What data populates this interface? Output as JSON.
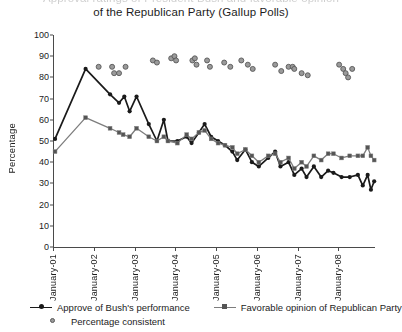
{
  "title": {
    "line_clipped": "Approval ratings of President Bush and favorable opinion",
    "line_visible": "of the Republican Party (Gallup Polls)"
  },
  "axes": {
    "ylabel": "Percentage",
    "yticks": [
      0,
      10,
      20,
      30,
      40,
      50,
      60,
      70,
      80,
      90,
      100
    ],
    "ymin": 0,
    "ymax": 100,
    "xticks": [
      "January-01",
      "January-02",
      "January-03",
      "January-04",
      "January-05",
      "January-06",
      "January-07",
      "January-08"
    ]
  },
  "legend": {
    "items": [
      {
        "label": "Approve of Bush's performance",
        "marker": "circle-line",
        "color": "#1a1a1a"
      },
      {
        "label": "Favorable opinion of Republican Party",
        "marker": "square-line",
        "color": "#7d7d7d"
      },
      {
        "label": "Percentage consistent",
        "marker": "circle-dot",
        "color": "#8a8a8a"
      }
    ]
  },
  "colors": {
    "approval_line": "#1a1a1a",
    "republican_line": "#7d7d7d",
    "consistent_dot_fill": "#9a9a9a",
    "consistent_dot_stroke": "#585858",
    "axis": "#4a4a4a",
    "text": "#1c1c1c"
  },
  "chart_data": {
    "type": "line",
    "title": "Approval ratings of President Bush and favorable opinion of the Republican Party (Gallup Polls)",
    "xlabel": "",
    "ylabel": "Percentage",
    "ylim": [
      0,
      100
    ],
    "xlim": [
      2001.0,
      2008.9
    ],
    "grid": false,
    "legend_position": "below",
    "xtick_values": [
      2001,
      2002,
      2003,
      2004,
      2005,
      2006,
      2007,
      2008
    ],
    "xtick_labels": [
      "January-01",
      "January-02",
      "January-03",
      "January-04",
      "January-05",
      "January-06",
      "January-07",
      "January-08"
    ],
    "series": [
      {
        "name": "Approve of Bush's performance",
        "style": "line+marker",
        "marker": "circle",
        "color": "#1a1a1a",
        "points": [
          [
            2001.05,
            51
          ],
          [
            2001.8,
            84
          ],
          [
            2002.4,
            72
          ],
          [
            2002.62,
            68
          ],
          [
            2002.75,
            71
          ],
          [
            2002.88,
            64
          ],
          [
            2003.05,
            71
          ],
          [
            2003.35,
            58
          ],
          [
            2003.55,
            50
          ],
          [
            2003.72,
            60
          ],
          [
            2003.82,
            50
          ],
          [
            2004.05,
            50
          ],
          [
            2004.28,
            52
          ],
          [
            2004.4,
            49
          ],
          [
            2004.58,
            54
          ],
          [
            2004.72,
            58
          ],
          [
            2004.88,
            52
          ],
          [
            2005.05,
            50
          ],
          [
            2005.22,
            48
          ],
          [
            2005.4,
            45
          ],
          [
            2005.52,
            41
          ],
          [
            2005.72,
            46
          ],
          [
            2005.88,
            40
          ],
          [
            2006.05,
            38
          ],
          [
            2006.28,
            42
          ],
          [
            2006.45,
            45
          ],
          [
            2006.58,
            38
          ],
          [
            2006.78,
            40
          ],
          [
            2006.92,
            34
          ],
          [
            2007.1,
            37
          ],
          [
            2007.22,
            33
          ],
          [
            2007.4,
            38
          ],
          [
            2007.58,
            33
          ],
          [
            2007.75,
            36
          ],
          [
            2007.88,
            35
          ],
          [
            2008.08,
            33
          ],
          [
            2008.28,
            33
          ],
          [
            2008.48,
            34
          ],
          [
            2008.6,
            29
          ],
          [
            2008.72,
            34
          ],
          [
            2008.8,
            27
          ],
          [
            2008.88,
            31
          ]
        ]
      },
      {
        "name": "Favorable opinion of Republican Party",
        "style": "line+marker",
        "marker": "square",
        "color": "#7d7d7d",
        "points": [
          [
            2001.05,
            45
          ],
          [
            2001.8,
            61
          ],
          [
            2002.4,
            56
          ],
          [
            2002.62,
            54
          ],
          [
            2002.72,
            53
          ],
          [
            2002.88,
            52
          ],
          [
            2003.05,
            56
          ],
          [
            2003.35,
            52
          ],
          [
            2003.55,
            50
          ],
          [
            2003.72,
            52
          ],
          [
            2003.82,
            50
          ],
          [
            2004.05,
            49
          ],
          [
            2004.28,
            53
          ],
          [
            2004.4,
            51
          ],
          [
            2004.58,
            54
          ],
          [
            2004.72,
            55
          ],
          [
            2004.88,
            51
          ],
          [
            2005.05,
            49
          ],
          [
            2005.22,
            48
          ],
          [
            2005.4,
            47
          ],
          [
            2005.52,
            44
          ],
          [
            2005.72,
            46
          ],
          [
            2005.88,
            43
          ],
          [
            2006.05,
            40
          ],
          [
            2006.28,
            43
          ],
          [
            2006.45,
            44
          ],
          [
            2006.58,
            40
          ],
          [
            2006.78,
            42
          ],
          [
            2006.92,
            37
          ],
          [
            2007.1,
            40
          ],
          [
            2007.22,
            38
          ],
          [
            2007.4,
            43
          ],
          [
            2007.58,
            41
          ],
          [
            2007.75,
            44
          ],
          [
            2007.88,
            44
          ],
          [
            2008.08,
            42
          ],
          [
            2008.28,
            43
          ],
          [
            2008.48,
            43
          ],
          [
            2008.6,
            43
          ],
          [
            2008.72,
            47
          ],
          [
            2008.8,
            43
          ],
          [
            2008.88,
            41
          ]
        ]
      },
      {
        "name": "Percentage consistent",
        "style": "scatter",
        "marker": "open-circle",
        "color": "#9a9a9a",
        "points": [
          [
            2002.12,
            85
          ],
          [
            2002.45,
            85
          ],
          [
            2002.5,
            82
          ],
          [
            2002.62,
            82
          ],
          [
            2002.78,
            85
          ],
          [
            2003.45,
            88
          ],
          [
            2003.55,
            87
          ],
          [
            2003.9,
            89
          ],
          [
            2003.98,
            90
          ],
          [
            2004.02,
            88
          ],
          [
            2004.42,
            88
          ],
          [
            2004.48,
            89
          ],
          [
            2004.52,
            86
          ],
          [
            2004.78,
            88
          ],
          [
            2004.85,
            85
          ],
          [
            2005.2,
            87
          ],
          [
            2005.35,
            85
          ],
          [
            2005.62,
            88
          ],
          [
            2005.78,
            86
          ],
          [
            2005.9,
            84
          ],
          [
            2006.45,
            86
          ],
          [
            2006.6,
            83
          ],
          [
            2006.78,
            85
          ],
          [
            2006.88,
            85
          ],
          [
            2006.92,
            84
          ],
          [
            2007.1,
            82
          ],
          [
            2007.25,
            81
          ],
          [
            2008.02,
            86
          ],
          [
            2008.12,
            84
          ],
          [
            2008.18,
            82
          ],
          [
            2008.24,
            80
          ],
          [
            2008.34,
            84
          ]
        ]
      }
    ]
  }
}
